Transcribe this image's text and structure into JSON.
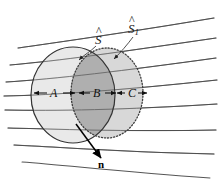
{
  "figure": {
    "caption_labels": {
      "surface_s": "S",
      "surface_s1": "S",
      "surface_s1_subscript": "1",
      "hat_accent": "^",
      "normal_vector": "n"
    },
    "segments": [
      {
        "id": "A",
        "label": "A"
      },
      {
        "id": "B",
        "label": "B"
      },
      {
        "id": "C",
        "label": "C"
      }
    ],
    "colors": {
      "background": "#ffffff",
      "ink": "#1a1a1a",
      "flow_line": "#555555",
      "circle_s_fill": "#e2e2e2",
      "circle_s1_fill": "#cfcfcf",
      "overlap_fill": "#a9a9a9",
      "circle_s_stroke": "#3a3a3a",
      "circle_s1_stroke": "#4a4a4a",
      "arrow": "#111111"
    },
    "flow_line_count": 8,
    "geometry": {
      "circle_s": {
        "cx": 73,
        "cy": 95,
        "rx": 42,
        "ry": 48
      },
      "circle_s1": {
        "cx": 107,
        "cy": 93,
        "rx": 36,
        "ry": 45
      }
    }
  }
}
